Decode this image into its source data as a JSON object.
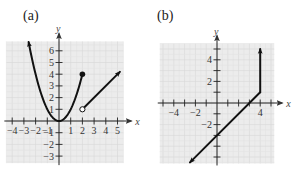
{
  "chart_data": [
    {
      "type": "line",
      "panel_label": "(a)",
      "xlabel": "x",
      "ylabel": "y",
      "xlim": [
        -4.5,
        5.5
      ],
      "ylim": [
        -3.6,
        6.8
      ],
      "grid": true,
      "x_tick_labels": [
        "-4",
        "-3",
        "-2",
        "-1",
        "1",
        "2",
        "3",
        "4",
        "5"
      ],
      "y_tick_labels": [
        "6",
        "5",
        "4",
        "3",
        "2",
        "1",
        "-1",
        "-2",
        "-3"
      ],
      "series": [
        {
          "name": "parabola y = x^2 (x ≤ 2)",
          "x": [
            -2.6,
            -2,
            -1.5,
            -1,
            -0.5,
            0,
            0.5,
            1,
            1.5,
            2
          ],
          "y": [
            6.76,
            4,
            2.25,
            1,
            0.25,
            0,
            0.25,
            1,
            2.25,
            4
          ],
          "start_marker": "arrow",
          "end_marker": "closed-dot"
        },
        {
          "name": "ray y = x - 1 (x > 2)",
          "x": [
            2,
            5.2
          ],
          "y": [
            1,
            4.2
          ],
          "start_marker": "open-dot",
          "end_marker": "arrow"
        }
      ]
    },
    {
      "type": "line",
      "panel_label": "(b)",
      "xlabel": "x",
      "ylabel": "y",
      "xlim": [
        -5.3,
        5.3
      ],
      "ylim": [
        -5.6,
        5.5
      ],
      "grid": true,
      "x_tick_labels": [
        "-4",
        "-2",
        "4"
      ],
      "y_tick_labels": [
        "4",
        "2",
        "-2"
      ],
      "series": [
        {
          "name": "line y = x - 3 (x ≤ 4)",
          "x": [
            -2.5,
            4
          ],
          "y": [
            -5.5,
            1
          ],
          "start_marker": "arrow",
          "end_marker": "none"
        },
        {
          "name": "vertical ray x = 4 (y ≥ 1)",
          "x": [
            4,
            4
          ],
          "y": [
            1,
            5
          ],
          "start_marker": "none",
          "end_marker": "arrow"
        }
      ]
    }
  ]
}
